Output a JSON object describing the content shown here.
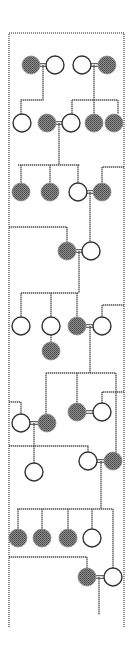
{
  "diagram": {
    "type": "pedigree",
    "colors": {
      "affected": "#6f6f6f",
      "unaffected": "#ffffff",
      "line": "#555555",
      "frame": "#8a8a8a"
    },
    "frame": {
      "left": 9,
      "right": 124,
      "top": 33,
      "bottom": 627
    },
    "radius": 9,
    "nodes": [
      {
        "id": "g1a",
        "x": 31,
        "y": 65,
        "affected": true
      },
      {
        "id": "g1b",
        "x": 55,
        "y": 65,
        "affected": false
      },
      {
        "id": "g1c",
        "x": 82,
        "y": 65,
        "affected": false
      },
      {
        "id": "g1d",
        "x": 107,
        "y": 65,
        "affected": true
      },
      {
        "id": "g2a",
        "x": 22,
        "y": 123,
        "affected": false
      },
      {
        "id": "g2b",
        "x": 47,
        "y": 123,
        "affected": true
      },
      {
        "id": "g2c",
        "x": 71,
        "y": 123,
        "affected": false
      },
      {
        "id": "g2d",
        "x": 94,
        "y": 123,
        "affected": true
      },
      {
        "id": "g2e",
        "x": 114,
        "y": 123,
        "affected": true
      },
      {
        "id": "g3a",
        "x": 21,
        "y": 192,
        "affected": true
      },
      {
        "id": "g3b",
        "x": 50,
        "y": 192,
        "affected": true
      },
      {
        "id": "g3c",
        "x": 78,
        "y": 192,
        "affected": false
      },
      {
        "id": "g3d",
        "x": 102,
        "y": 192,
        "affected": true
      },
      {
        "id": "g4a",
        "x": 67,
        "y": 251,
        "affected": true
      },
      {
        "id": "g4b",
        "x": 91,
        "y": 251,
        "affected": false
      },
      {
        "id": "g5a",
        "x": 21,
        "y": 326,
        "affected": false
      },
      {
        "id": "g5b",
        "x": 51,
        "y": 326,
        "affected": false
      },
      {
        "id": "g5c",
        "x": 77,
        "y": 326,
        "affected": true
      },
      {
        "id": "g5d",
        "x": 102,
        "y": 326,
        "affected": false
      },
      {
        "id": "g5e",
        "x": 51,
        "y": 351,
        "affected": true
      },
      {
        "id": "g6a",
        "x": 21,
        "y": 423,
        "affected": false
      },
      {
        "id": "g6b",
        "x": 47,
        "y": 423,
        "affected": true
      },
      {
        "id": "g6c",
        "x": 77,
        "y": 412,
        "affected": true
      },
      {
        "id": "g6d",
        "x": 102,
        "y": 412,
        "affected": false
      },
      {
        "id": "g7a",
        "x": 34,
        "y": 472,
        "affected": false
      },
      {
        "id": "g7b",
        "x": 88,
        "y": 461,
        "affected": false
      },
      {
        "id": "g7c",
        "x": 113,
        "y": 461,
        "affected": true
      },
      {
        "id": "g8a",
        "x": 18,
        "y": 538,
        "affected": true
      },
      {
        "id": "g8b",
        "x": 42,
        "y": 538,
        "affected": true
      },
      {
        "id": "g8c",
        "x": 68,
        "y": 538,
        "affected": true
      },
      {
        "id": "g8d",
        "x": 92,
        "y": 538,
        "affected": false
      },
      {
        "id": "g9a",
        "x": 87,
        "y": 577,
        "affected": true
      },
      {
        "id": "g9b",
        "x": 113,
        "y": 577,
        "affected": false
      }
    ],
    "marriages": [
      {
        "x1": 40,
        "x2": 46,
        "y": 65
      },
      {
        "x1": 91,
        "x2": 98,
        "y": 65
      },
      {
        "x1": 56,
        "x2": 62,
        "y": 123
      },
      {
        "x1": 87,
        "x2": 93,
        "y": 192
      },
      {
        "x1": 76,
        "x2": 82,
        "y": 251
      },
      {
        "x1": 86,
        "x2": 93,
        "y": 326
      },
      {
        "x1": 30,
        "x2": 38,
        "y": 423
      },
      {
        "x1": 86,
        "x2": 93,
        "y": 412
      },
      {
        "x1": 97,
        "x2": 104,
        "y": 461
      },
      {
        "x1": 96,
        "x2": 104,
        "y": 577
      }
    ],
    "paths": [
      "M43 65 V100 H21 V114",
      "M94 65 V100",
      "M72 100 H118",
      "M72 100 V114",
      "M118 100 V114",
      "M94 100 V114",
      "M59 123 V165",
      "M18 165 H80",
      "M21 165 V183",
      "M50 165 V183",
      "M78 165 V183",
      "M124 167 H102 V183",
      "M90 192 V242",
      "M9 227 H67 V242",
      "M79 251 V293",
      "M21 293 H79",
      "M21 293 V317",
      "M51 293 V317",
      "M77 293 V317",
      "M51 335 V342",
      "M124 305 H102 V317",
      "M90 326 V373",
      "M46 373 H116",
      "M46 373 V414",
      "M77 373 V403",
      "M116 373 V385",
      "M124 392 H102 V403",
      "M9 402 H21 V414",
      "M34 423 V446",
      "M9 446 H88 V452",
      "M34 446 V463",
      "M116 385 V452",
      "M101 461 V509",
      "M17 509 H113",
      "M18 509 V529",
      "M42 509 V529",
      "M68 509 V529",
      "M92 509 V529",
      "M113 509 V568",
      "M9 557 H87 V568",
      "M99 577 V615"
    ]
  }
}
